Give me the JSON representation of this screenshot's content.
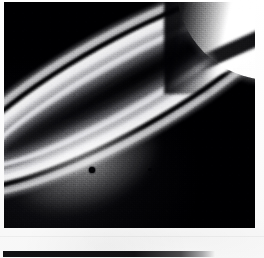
{
  "page": {
    "kind": "photographic-plate",
    "medium": "black-and-white halftone print",
    "background_color": "#fdfdfd",
    "width": 264,
    "height": 258
  },
  "photo": {
    "name": "saturn-rings-photograph",
    "subject": "Saturn ring system viewed at low phase, planet limb at upper right",
    "frame": {
      "x": 4,
      "y": 2,
      "width": 251,
      "height": 226
    },
    "background_color": "#08080b",
    "highlight_color": "#f4f4f6",
    "midtone_color": "#9a9a9f",
    "shadow_color": "#0a0a0d",
    "orientation": "rings sweep diagonally from upper-right to lower-left"
  },
  "features": [
    {
      "name": "planet-limb",
      "label": "Planet limb",
      "description": "Bright overexposed crescent of the planet body occupying the upper-right corner",
      "tone": "highlight"
    },
    {
      "name": "ring-shadow-on-planet",
      "label": "Ring shadow",
      "description": "Dark band of ring shadow cast across the sunlit planet face",
      "tone": "shadow"
    },
    {
      "name": "outer-ring-a",
      "label": "Outer bright ring",
      "description": "Broad bright outer ring band running the full diagonal of the frame",
      "tone": "highlight"
    },
    {
      "name": "ring-division",
      "label": "Ring division",
      "description": "Dark gap separating the outer bright ring from the inner bright ring",
      "tone": "shadow"
    },
    {
      "name": "inner-ring-b",
      "label": "Inner bright ring",
      "description": "Densest, brightest ring band curving around the ansa at lower left",
      "tone": "highlight"
    },
    {
      "name": "inner-ring-c",
      "label": "Faint inner ring",
      "description": "Dim inner ring material fading toward the planet",
      "tone": "midtone"
    },
    {
      "name": "ring-ansa",
      "label": "Ring ansa",
      "description": "Rounded tip of the rings where the ellipse turns back on itself at lower left",
      "tone": "highlight"
    },
    {
      "name": "satellite-speck",
      "label": "Satellite",
      "description": "Small dark point source embedded in the bright inner ring",
      "tone": "shadow"
    },
    {
      "name": "film-grain",
      "label": "Film grain",
      "description": "Coarse photographic grain and halftone screen texture over the whole print",
      "tone": "texture"
    }
  ],
  "bottom_bar": {
    "name": "bottom-rule",
    "description": "Dark horizontal rule at the foot of the page fading out toward the right",
    "color": "#121214"
  }
}
